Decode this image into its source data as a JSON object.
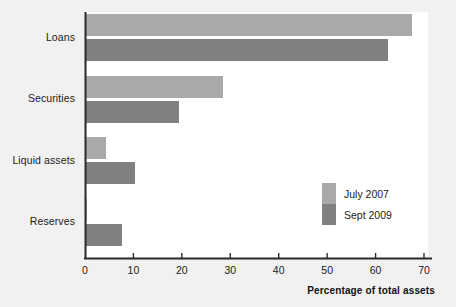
{
  "chart_data": {
    "type": "bar",
    "orientation": "horizontal",
    "title": "",
    "xlabel": "Percentage of total assets",
    "ylabel": "",
    "xlim": [
      0,
      70
    ],
    "xticks": [
      "0",
      "10",
      "20",
      "30",
      "40",
      "50",
      "60",
      "70"
    ],
    "xtick_values": [
      0,
      10,
      20,
      30,
      40,
      50,
      60,
      70
    ],
    "grid": false,
    "legend_position": "inside-lower-right",
    "categories": [
      "Loans",
      "Securities",
      "Liquid assets",
      "Reserves"
    ],
    "series": [
      {
        "name": "July 2007",
        "color": "#a9a9a9",
        "values": [
          67.5,
          28.5,
          4.3,
          0.5
        ]
      },
      {
        "name": "Sept 2009",
        "color": "#808080",
        "values": [
          62.5,
          19.5,
          10.3,
          7.6
        ]
      }
    ]
  },
  "axis": {
    "x_title": "Percentage of total assets",
    "ticks": [
      {
        "label": "0",
        "value": 0
      },
      {
        "label": "10",
        "value": 10
      },
      {
        "label": "20",
        "value": 20
      },
      {
        "label": "30",
        "value": 30
      },
      {
        "label": "40",
        "value": 40
      },
      {
        "label": "50",
        "value": 50
      },
      {
        "label": "60",
        "value": 60
      },
      {
        "label": "70",
        "value": 70
      }
    ]
  },
  "categories": [
    {
      "label": "Loans"
    },
    {
      "label": "Securities"
    },
    {
      "label": "Liquid assets"
    },
    {
      "label": "Reserves"
    }
  ],
  "legend": {
    "items": [
      {
        "label": "July 2007",
        "color": "#a9a9a9"
      },
      {
        "label": "Sept 2009",
        "color": "#808080"
      }
    ]
  },
  "colors": {
    "background": "#f1f1f1",
    "plot_background": "#ffffff",
    "axis": "#2b2b2b",
    "series_light": "#a9a9a9",
    "series_dark": "#808080",
    "text": "#1b1b1b"
  }
}
